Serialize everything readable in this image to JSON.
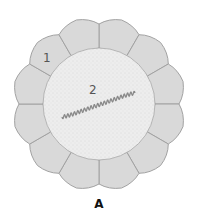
{
  "figure": {
    "caption": "A",
    "labels": [
      {
        "id": "1",
        "text": "1",
        "x": 43,
        "y": 62
      },
      {
        "id": "2",
        "text": "2",
        "x": 89,
        "y": 94
      }
    ],
    "outer_cell_count": 12,
    "colors": {
      "cell_fill": "#d9d9d9",
      "cell_border": "#a2a2a2",
      "inner_fill": "#ececec",
      "wavy_line": "#8a8a8a",
      "label": "#555555"
    }
  }
}
